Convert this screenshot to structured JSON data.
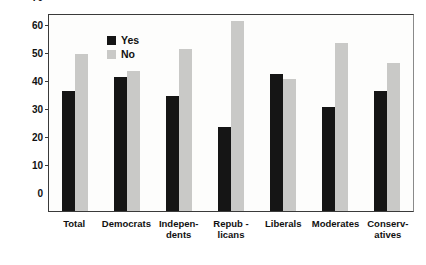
{
  "chart_data": {
    "type": "bar",
    "title": "",
    "xlabel": "",
    "ylabel": "Percent",
    "ylim": [
      0,
      70
    ],
    "yticks": [
      0,
      10,
      20,
      30,
      40,
      50,
      60,
      70
    ],
    "grid": false,
    "legend_position": "top-left",
    "categories": [
      "Total",
      "Democrats",
      "Indepen-\ndents",
      "Repub -\nlicans",
      "Liberals",
      "Moderates",
      "Conserv-\natives"
    ],
    "series": [
      {
        "name": "Yes",
        "color": "#151515",
        "values": [
          43,
          48,
          41,
          30,
          49,
          37,
          43
        ]
      },
      {
        "name": "No",
        "color": "#c9c9c7",
        "values": [
          56,
          50,
          58,
          68,
          47,
          60,
          53
        ]
      }
    ]
  },
  "legend": {
    "items": [
      {
        "label": "Yes",
        "color": "#151515"
      },
      {
        "label": "No",
        "color": "#c9c9c7"
      }
    ]
  },
  "axis": {
    "y_title": "Percent"
  },
  "colors": {
    "yes": "#151515",
    "no": "#c9c9c7",
    "frame": "#3a3a3a",
    "background": "#ffffff"
  }
}
